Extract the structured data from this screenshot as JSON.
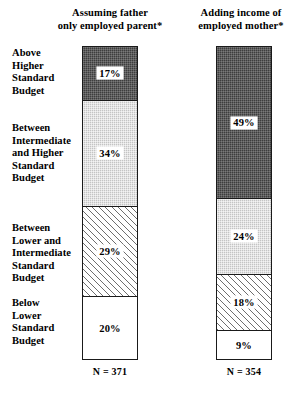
{
  "chart_data": {
    "type": "bar",
    "title": "",
    "subtitle": "",
    "xlabel": "",
    "ylabel": "",
    "ylim": [
      0,
      100
    ],
    "grid": false,
    "legend_position": "left-axis-labels",
    "stacked": true,
    "units": "percent",
    "categories": [
      "Above Higher Standard Budget",
      "Between Intermediate and Higher Standard Budget",
      "Between Lower and Intermediate Standard Budget",
      "Below Lower Standard Budget"
    ],
    "series": [
      {
        "name": "Assuming father only employed parent*",
        "n": 371,
        "n_label": "N = 371",
        "values": [
          17,
          34,
          29,
          20
        ],
        "value_labels": [
          "17%",
          "34%",
          "29%",
          "20%"
        ]
      },
      {
        "name": "Adding income of employed mother*",
        "n": 354,
        "n_label": "N = 354",
        "values": [
          49,
          24,
          18,
          9
        ],
        "value_labels": [
          "49%",
          "24%",
          "18%",
          "9%"
        ]
      }
    ],
    "fills": [
      "dark-dither",
      "light-dither",
      "diagonal-hatch",
      "white"
    ],
    "colors": {
      "dark": "#3d3d3d",
      "light": "#c4c4c4",
      "hatch": "#6e6e6e",
      "white": "#ffffff",
      "outline": "#1a1a1a",
      "text": "#000000"
    }
  },
  "headers": {
    "left_line1": "Assuming father",
    "left_line2": "only employed parent*",
    "right_line1": "Adding income of",
    "right_line2": "employed mother*"
  },
  "category_labels": [
    {
      "line1": "Above",
      "line2": "Higher",
      "line3": "Standard",
      "line4": "Budget"
    },
    {
      "line1": "Between",
      "line2": "Intermediate",
      "line3": "and Higher",
      "line4": "Standard",
      "line5": "Budget"
    },
    {
      "line1": "Between",
      "line2": "Lower and",
      "line3": "Intermediate",
      "line4": "Standard",
      "line5": "Budget"
    },
    {
      "line1": "Below",
      "line2": "Lower",
      "line3": "Standard",
      "line4": "Budget"
    }
  ],
  "bar_left": {
    "segments": [
      {
        "label": "17%",
        "pct": 17
      },
      {
        "label": "34%",
        "pct": 34
      },
      {
        "label": "29%",
        "pct": 29
      },
      {
        "label": "20%",
        "pct": 20
      }
    ],
    "n_label": "N = 371"
  },
  "bar_right": {
    "segments": [
      {
        "label": "49%",
        "pct": 49
      },
      {
        "label": "24%",
        "pct": 24
      },
      {
        "label": "18%",
        "pct": 18
      },
      {
        "label": "9%",
        "pct": 9
      }
    ],
    "n_label": "N = 354"
  }
}
